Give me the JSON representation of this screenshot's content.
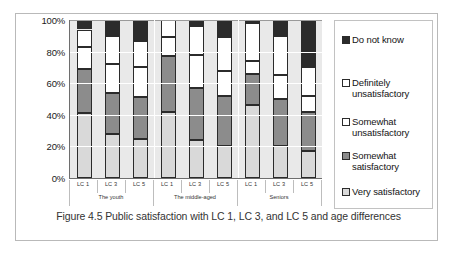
{
  "figure": {
    "caption": "Figure 4.5 Public satisfaction with LC 1, LC 3, and LC 5 and age differences"
  },
  "legend": {
    "title": "",
    "items": [
      {
        "label": "Do not know",
        "color": "#2b2b2b"
      },
      {
        "label": "Definitely\nunsatisfactory",
        "color": "#ffffff"
      },
      {
        "label": "Somewhat\nunsatisfactory",
        "color": "#ffffff"
      },
      {
        "label": "Somewhat\nsatisfactory",
        "color": "#8c8c8c"
      },
      {
        "label": "Very satisfactory",
        "color": "#d9d9d9"
      }
    ]
  },
  "axis": {
    "y_ticks": [
      "100%",
      "80%",
      "60%",
      "40%",
      "20%",
      "0%"
    ]
  },
  "chart_data": {
    "type": "bar",
    "subtype": "stacked-percent",
    "title": "Figure 4.5 Public satisfaction with LC 1, LC 3, and LC 5 and age differences",
    "xlabel": "",
    "ylabel": "",
    "ylim": [
      0,
      100
    ],
    "y_tick_values": [
      0,
      20,
      40,
      60,
      80,
      100
    ],
    "grid": true,
    "legend_position": "right",
    "categories": [
      "LC 1",
      "LC 3",
      "LC 5",
      "LC 1",
      "LC 3",
      "LC 5",
      "LC 1",
      "LC 3",
      "LC 5"
    ],
    "groups": [
      {
        "name": "The youth",
        "categories": [
          "LC 1",
          "LC 3",
          "LC 5"
        ]
      },
      {
        "name": "The middle-aged",
        "categories": [
          "LC 1",
          "LC 3",
          "LC 5"
        ]
      },
      {
        "name": "Seniors",
        "categories": [
          "LC 1",
          "LC 3",
          "LC 5"
        ]
      }
    ],
    "series": [
      {
        "name": "Very satisfactory",
        "color": "#d9d9d9",
        "values": [
          41,
          28,
          25,
          42,
          24,
          20,
          46,
          20,
          17
        ]
      },
      {
        "name": "Somewhat satisfactory",
        "color": "#8c8c8c",
        "values": [
          28,
          26,
          26,
          35,
          33,
          32,
          20,
          30,
          25
        ]
      },
      {
        "name": "Somewhat unsatisfactory",
        "color": "#ffffff",
        "values": [
          14,
          18,
          19,
          12,
          21,
          16,
          8,
          15,
          10
        ]
      },
      {
        "name": "Definitely unsatisfactory",
        "color": "#ffffff",
        "values": [
          11,
          18,
          17,
          11,
          18,
          21,
          24,
          25,
          18
        ]
      },
      {
        "name": "Do not know",
        "color": "#2b2b2b",
        "values": [
          6,
          10,
          13,
          0,
          4,
          11,
          2,
          10,
          30
        ]
      }
    ]
  }
}
